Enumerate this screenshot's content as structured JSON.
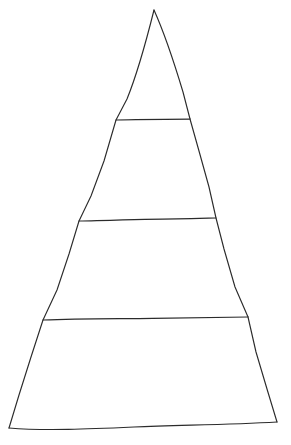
{
  "diagram": {
    "type": "pyramid",
    "style": "hand-drawn outline",
    "background_color": "#ffffff",
    "stroke_color": "#2b2b2b",
    "fill_color": "#ffffff",
    "level_count": 4,
    "labels_present": false,
    "canvas": {
      "width": 291,
      "height": 445
    },
    "apex": {
      "x": 154,
      "y": 10
    },
    "base": {
      "left_x": 9,
      "left_y": 428,
      "right_x": 277,
      "right_y": 422
    },
    "levels": [
      {
        "index": 1,
        "name": "apex-level",
        "label": "",
        "top_y": 10,
        "bottom_y": 120,
        "left_x": 116,
        "right_x": 190
      },
      {
        "index": 2,
        "name": "upper-middle-level",
        "label": "",
        "top_y": 120,
        "bottom_y": 220,
        "left_x": 80,
        "right_x": 216
      },
      {
        "index": 3,
        "name": "lower-middle-level",
        "label": "",
        "top_y": 220,
        "bottom_y": 318,
        "left_x": 43,
        "right_x": 248
      },
      {
        "index": 4,
        "name": "base-level",
        "label": "",
        "top_y": 318,
        "bottom_y": 428,
        "left_x": 9,
        "right_x": 277
      }
    ],
    "dividers": [
      {
        "index": 1,
        "name": "divider-line-1",
        "x1": 116,
        "y1": 120,
        "x2": 190,
        "y2": 119
      },
      {
        "index": 2,
        "name": "divider-line-2",
        "x1": 79,
        "y1": 221,
        "x2": 216,
        "y2": 218
      },
      {
        "index": 3,
        "name": "divider-line-3",
        "x1": 43,
        "y1": 320,
        "x2": 248,
        "y2": 317
      }
    ],
    "edges": {
      "left_edge_name": "pyramid-left-edge",
      "right_edge_name": "pyramid-right-edge",
      "base_edge_name": "pyramid-base-edge"
    },
    "geometry": {
      "left_edge_path": "M154,10 C148,34 138,72 127,99 L116,120 L104,161 L91,196 L79,221 L69,254 L57,290 L43,320 L31,357 L19,395 L9,428",
      "right_edge_path": "M154,10 C163,30 174,62 183,92 L190,119 L199,151 L209,187 L216,218 L224,249 L235,287 L248,317 L256,352 L267,389 L277,422",
      "base_path": "M9,428 C45,431 90,429 134,427 C178,425 226,425 277,422",
      "divider1_path": "M116,120 C133,119.3 158,119.1 190,119",
      "divider2_path": "M79,221 C110,220.2 147,219.1 177,218.8 C194,218.6 207,218.2 216,218",
      "divider3_path": "M43,320 C80,318.4 118,318.8 153,318.3 C190,317.8 222,317.4 248,317"
    }
  }
}
